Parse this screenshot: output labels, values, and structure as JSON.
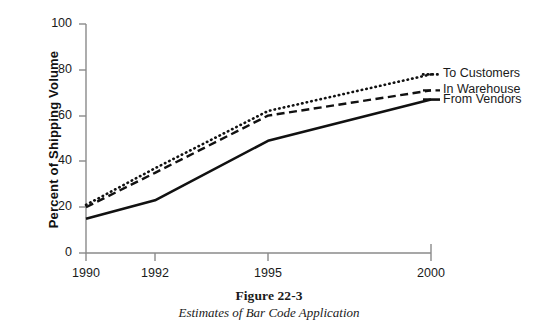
{
  "figure": {
    "caption_title": "Figure 22-3",
    "caption_subtitle": "Estimates of Bar Code Application"
  },
  "axes": {
    "y_title": "Percent of Shipping Volume",
    "y_ticks": [
      "0",
      "20",
      "40",
      "60",
      "80",
      "100"
    ],
    "x_ticks": [
      "1990",
      "1992",
      "1995",
      "2000"
    ]
  },
  "legend": {
    "items": [
      {
        "label": "To Customers",
        "style": "dotted"
      },
      {
        "label": "In Warehouse",
        "style": "dashed"
      },
      {
        "label": "From Vendors",
        "style": "solid"
      }
    ]
  },
  "colors": {
    "line": "#111111",
    "axis": "#8a8a8a",
    "background": "#ffffff"
  },
  "chart_data": {
    "type": "line",
    "title": "Figure 22-3",
    "subtitle": "Estimates of Bar Code Application",
    "xlabel": "",
    "ylabel": "Percent of Shipping Volume",
    "categories": [
      "1990",
      "1992",
      "1995",
      "2000"
    ],
    "x": [
      1990,
      1992,
      1995,
      2000
    ],
    "ylim": [
      0,
      100
    ],
    "yticks": [
      0,
      20,
      40,
      60,
      80,
      100
    ],
    "grid": false,
    "legend_position": "right-of-line-ends",
    "series": [
      {
        "name": "To Customers",
        "style": "dotted",
        "values": [
          21,
          37,
          62,
          78
        ]
      },
      {
        "name": "In Warehouse",
        "style": "dashed",
        "values": [
          20,
          35,
          60,
          71
        ]
      },
      {
        "name": "From Vendors",
        "style": "solid",
        "values": [
          15,
          23,
          49,
          67
        ]
      }
    ]
  },
  "geometry": {
    "plot_left": 86,
    "plot_right": 431,
    "plot_top": 24,
    "plot_bottom": 253,
    "x_pixels": [
      86,
      155,
      268,
      431
    ],
    "y_tick_pixels": [
      253,
      207,
      161,
      116,
      70,
      24
    ]
  }
}
